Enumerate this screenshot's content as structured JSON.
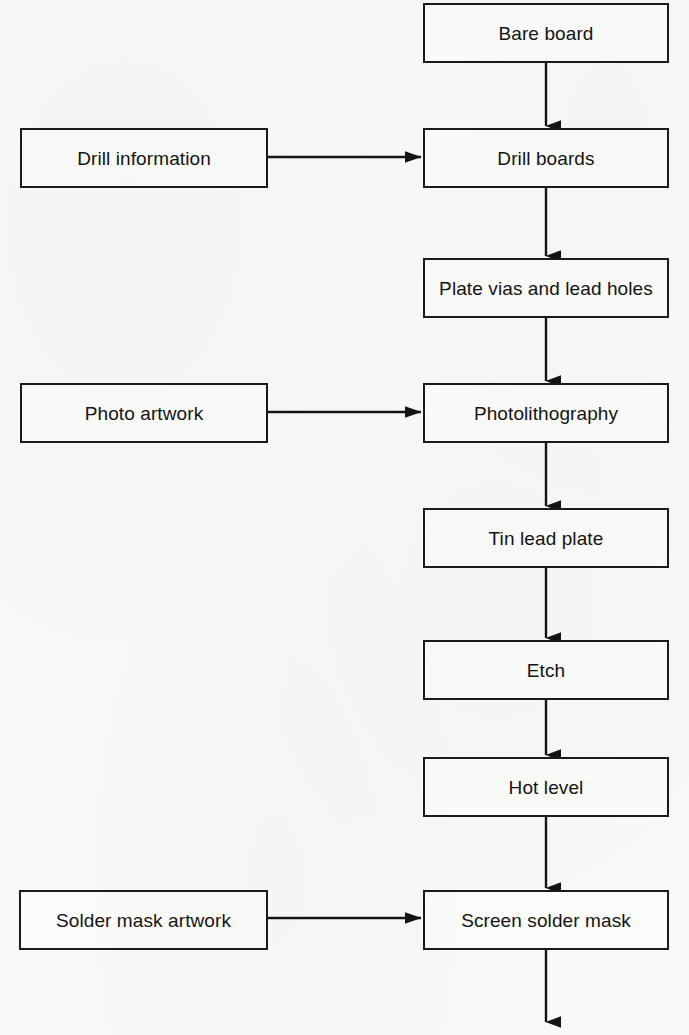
{
  "diagram": {
    "type": "flowchart",
    "orientation": "top-to-bottom with left side inputs",
    "colors": {
      "background": "#f8f8f6",
      "box_fill": "#fbfbf9",
      "stroke": "#1a1a1a",
      "text": "#141414"
    },
    "process_nodes": [
      {
        "id": "bare-board",
        "label": "Bare board",
        "x": 423,
        "y": 3,
        "w": 246,
        "h": 60
      },
      {
        "id": "drill-boards",
        "label": "Drill boards",
        "x": 423,
        "y": 128,
        "w": 246,
        "h": 60
      },
      {
        "id": "plate-vias",
        "label": "Plate vias and lead holes",
        "x": 423,
        "y": 258,
        "w": 246,
        "h": 60
      },
      {
        "id": "photolithography",
        "label": "Photolithography",
        "x": 423,
        "y": 383,
        "w": 246,
        "h": 60
      },
      {
        "id": "tin-lead-plate",
        "label": "Tin lead plate",
        "x": 423,
        "y": 508,
        "w": 246,
        "h": 60
      },
      {
        "id": "etch",
        "label": "Etch",
        "x": 423,
        "y": 640,
        "w": 246,
        "h": 60
      },
      {
        "id": "hot-level",
        "label": "Hot level",
        "x": 423,
        "y": 757,
        "w": 246,
        "h": 60
      },
      {
        "id": "screen-solder-mask",
        "label": "Screen solder mask",
        "x": 423,
        "y": 890,
        "w": 246,
        "h": 60
      }
    ],
    "input_nodes": [
      {
        "id": "drill-information",
        "label": "Drill information",
        "x": 20,
        "y": 128,
        "w": 248,
        "h": 60,
        "target": "drill-boards"
      },
      {
        "id": "photo-artwork",
        "label": "Photo artwork",
        "x": 20,
        "y": 383,
        "w": 248,
        "h": 60,
        "target": "photolithography"
      },
      {
        "id": "solder-mask-artwork",
        "label": "Solder mask artwork",
        "x": 19,
        "y": 890,
        "w": 249,
        "h": 60,
        "target": "screen-solder-mask"
      }
    ],
    "vertical_edges": [
      {
        "from": "bare-board",
        "to": "drill-boards",
        "x": 546,
        "y1": 63,
        "y2": 126
      },
      {
        "from": "drill-boards",
        "to": "plate-vias",
        "x": 546,
        "y1": 188,
        "y2": 256
      },
      {
        "from": "plate-vias",
        "to": "photolithography",
        "x": 546,
        "y1": 318,
        "y2": 381
      },
      {
        "from": "photolithography",
        "to": "tin-lead-plate",
        "x": 546,
        "y1": 443,
        "y2": 506
      },
      {
        "from": "tin-lead-plate",
        "to": "etch",
        "x": 546,
        "y1": 568,
        "y2": 638
      },
      {
        "from": "etch",
        "to": "hot-level",
        "x": 546,
        "y1": 700,
        "y2": 755
      },
      {
        "from": "hot-level",
        "to": "screen-solder-mask",
        "x": 546,
        "y1": 817,
        "y2": 888
      },
      {
        "from": "screen-solder-mask",
        "to": "continues-below",
        "x": 546,
        "y1": 950,
        "y2": 1022
      }
    ],
    "horizontal_edges": [
      {
        "from": "drill-information",
        "to": "drill-boards",
        "y": 157,
        "x1": 268,
        "x2": 421
      },
      {
        "from": "photo-artwork",
        "to": "photolithography",
        "y": 412,
        "x1": 268,
        "x2": 421
      },
      {
        "from": "solder-mask-artwork",
        "to": "screen-solder-mask",
        "y": 918,
        "x1": 268,
        "x2": 421
      }
    ]
  }
}
